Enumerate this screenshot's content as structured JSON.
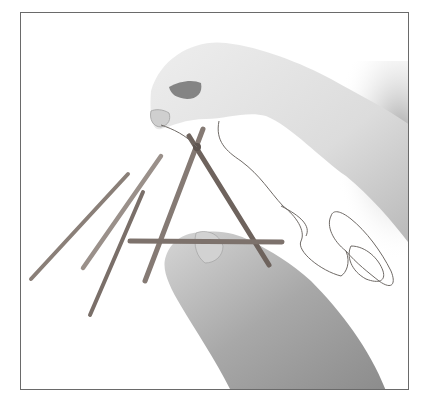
{
  "image": {
    "subject": "hands tying sticks together with string",
    "palette": {
      "background": "#ffffff",
      "border": "#6a6a6a",
      "skin_light": "#e6e6e6",
      "skin_mid": "#c8c8c8",
      "skin_shadow": "#9a9a9a",
      "stick": "#8a7f78",
      "stick_dark": "#6e635d",
      "string": "#6f6a66"
    },
    "elements": [
      {
        "name": "upper-hand-holding-string"
      },
      {
        "name": "lower-hand-holding-stick"
      },
      {
        "name": "stick-triangle-frame"
      },
      {
        "name": "loose-sticks"
      },
      {
        "name": "coiled-string"
      }
    ]
  }
}
